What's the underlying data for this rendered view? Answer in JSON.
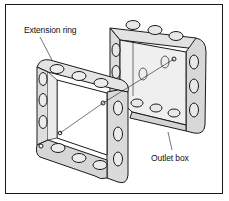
{
  "figure": {
    "labels": {
      "extension_ring": "Extension ring",
      "outlet_box": "Outlet box"
    },
    "colors": {
      "line": "#1a1a1a",
      "fill_light": "#e6e6e6",
      "fill_mid": "#d2d2d2",
      "fill_inner": "#eeeeee",
      "background": "#ffffff"
    }
  }
}
